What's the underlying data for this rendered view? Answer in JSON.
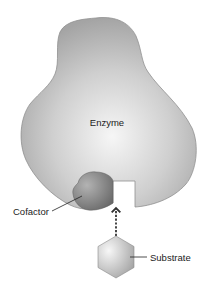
{
  "diagram": {
    "labels": {
      "enzyme": "Enzyme",
      "cofactor": "Cofactor",
      "substrate": "Substrate"
    },
    "colors": {
      "enzyme_edge": "#8f8f8f",
      "enzyme_center": "#f4f4f4",
      "enzyme_outer": "#a6a6a6",
      "cofactor_dark": "#6f6f6f",
      "cofactor_light": "#a9a9a9",
      "substrate_light": "#f5f5f5",
      "substrate_dark": "#a8a8a8",
      "arrow": "#333333",
      "leader_line": "#222222"
    },
    "arrow_style": "dashed"
  }
}
